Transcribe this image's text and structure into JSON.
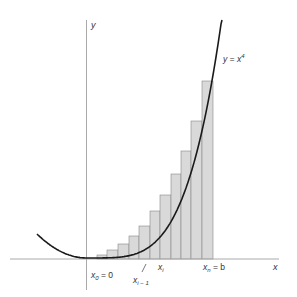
{
  "figure": {
    "curve_label": "y = x",
    "curve_label_exp": "4",
    "axis_x_label": "x",
    "axis_y_label": "y",
    "label_x0": "x",
    "label_x0_sub": "0",
    "label_x0_rest": " = 0",
    "label_xi": "x",
    "label_xi_sub": "i",
    "label_xim1": "x",
    "label_xim1_sub": "i − 1",
    "label_xn": "x",
    "label_xn_sub": "n",
    "label_xn_rest": " = b",
    "colors": {
      "axis": "#aaaaaa",
      "curve": "#1a1a1a",
      "bar_fill": "#d9d9d9",
      "bar_stroke": "#888888",
      "text": "#333333"
    }
  },
  "chart_data": {
    "type": "bar",
    "title": "",
    "function": "y = x^4",
    "interval": [
      "x0 = 0",
      "xn = b"
    ],
    "num_rectangles": 11,
    "bars_px": [
      {
        "x0": 97,
        "x1": 107,
        "top": 255
      },
      {
        "x0": 107,
        "x1": 118,
        "top": 250
      },
      {
        "x0": 118,
        "x1": 129,
        "top": 244
      },
      {
        "x0": 129,
        "x1": 139,
        "top": 236
      },
      {
        "x0": 139,
        "x1": 150,
        "top": 226
      },
      {
        "x0": 150,
        "x1": 160,
        "top": 211
      },
      {
        "x0": 160,
        "x1": 171,
        "top": 195
      },
      {
        "x0": 171,
        "x1": 181,
        "top": 174
      },
      {
        "x0": 181,
        "x1": 191,
        "top": 151
      },
      {
        "x0": 191,
        "x1": 202,
        "top": 121
      },
      {
        "x0": 202,
        "x1": 213,
        "top": 81
      }
    ],
    "xlabel": "x",
    "ylabel": "y",
    "grid": false
  }
}
